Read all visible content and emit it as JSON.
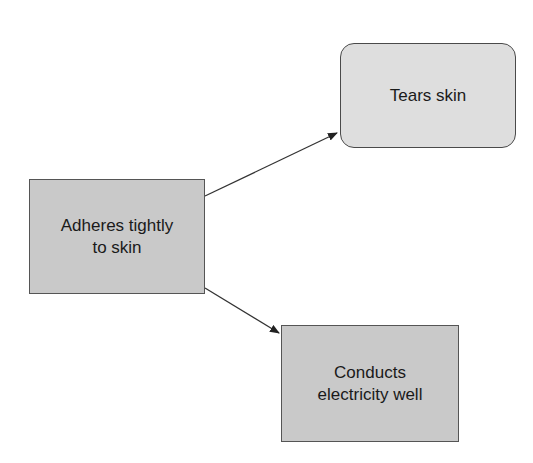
{
  "diagram": {
    "type": "cause-effect flow",
    "nodes": [
      {
        "id": "adheres",
        "label": "Adheres tightly\nto skin",
        "shape": "rectangle",
        "fill": "#c9c9c9"
      },
      {
        "id": "tears",
        "label": "Tears skin",
        "shape": "rounded-rectangle",
        "fill": "#dedede"
      },
      {
        "id": "conducts",
        "label": "Conducts\nelectricity well",
        "shape": "rectangle",
        "fill": "#c9c9c9"
      }
    ],
    "edges": [
      {
        "from": "adheres",
        "to": "tears",
        "directed": true
      },
      {
        "from": "adheres",
        "to": "conducts",
        "directed": true
      }
    ],
    "colors": {
      "stroke": "#4a4a4a",
      "text": "#1a1a1a",
      "background": "#ffffff"
    }
  }
}
